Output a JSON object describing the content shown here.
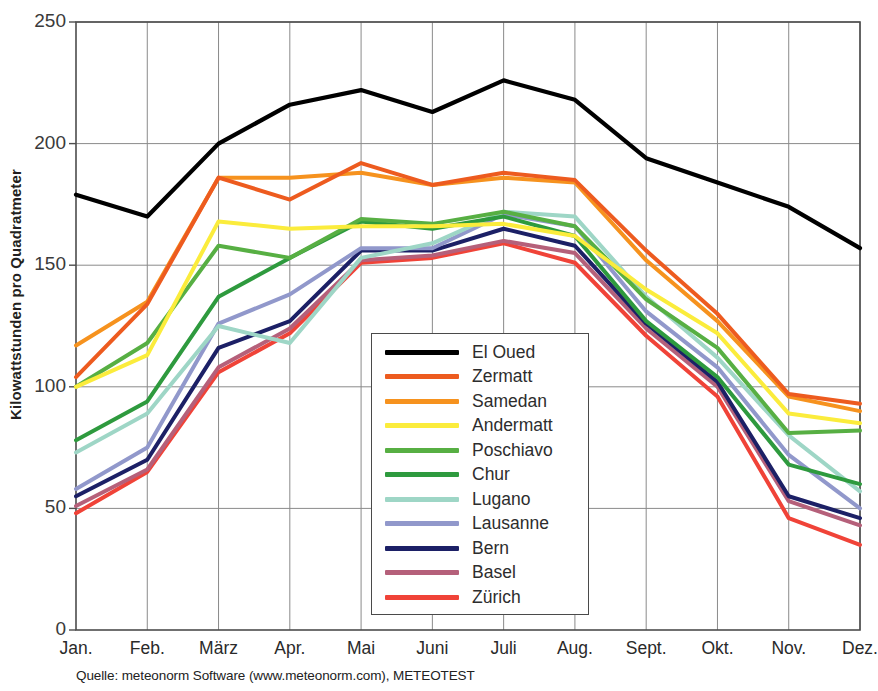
{
  "figure": {
    "title_fragment": "Globalstrahlung Monatssummen (kWh/m²)",
    "source_note": "Quelle: meteonorm Software (www.meteonorm.com), METEOTEST",
    "y_axis_label": "Kilowattstunden pro Quadratmeter"
  },
  "chart_data": {
    "type": "line",
    "title": "Globalstrahlung Monatssummen (kWh/m²)",
    "xlabel": "",
    "ylabel": "Kilowattstunden pro Quadratmeter",
    "ylim": [
      0,
      250
    ],
    "yticks": [
      0,
      50,
      100,
      150,
      200,
      250
    ],
    "grid": true,
    "legend_position": "center",
    "categories": [
      "Jan.",
      "Feb.",
      "März",
      "Apr.",
      "Mai",
      "Juni",
      "Juli",
      "Aug.",
      "Sept.",
      "Okt.",
      "Nov.",
      "Dez."
    ],
    "series": [
      {
        "name": "El Oued",
        "color": "#000000",
        "values": [
          179,
          170,
          200,
          216,
          222,
          213,
          226,
          218,
          194,
          184,
          174,
          157
        ]
      },
      {
        "name": "Zermatt",
        "color": "#ED5B1F",
        "values": [
          104,
          134,
          186,
          177,
          192,
          183,
          188,
          185,
          156,
          130,
          97,
          93
        ]
      },
      {
        "name": "Samedan",
        "color": "#F6921E",
        "values": [
          117,
          135,
          186,
          186,
          188,
          183,
          186,
          184,
          152,
          127,
          96,
          90
        ]
      },
      {
        "name": "Andermatt",
        "color": "#FBEC3C",
        "values": [
          100,
          113,
          168,
          165,
          166,
          166,
          167,
          162,
          140,
          122,
          89,
          85
        ]
      },
      {
        "name": "Poschiavo",
        "color": "#57AF43",
        "values": [
          100,
          118,
          158,
          153,
          169,
          167,
          172,
          166,
          136,
          116,
          81,
          82
        ]
      },
      {
        "name": "Chur",
        "color": "#2E9A3E",
        "values": [
          78,
          94,
          137,
          153,
          168,
          165,
          170,
          162,
          127,
          104,
          68,
          60
        ]
      },
      {
        "name": "Lugano",
        "color": "#9ED6C6",
        "values": [
          73,
          89,
          125,
          118,
          153,
          159,
          172,
          170,
          137,
          112,
          80,
          57
        ]
      },
      {
        "name": "Lausanne",
        "color": "#9198CB",
        "values": [
          58,
          75,
          126,
          138,
          157,
          157,
          171,
          166,
          131,
          108,
          72,
          50
        ]
      },
      {
        "name": "Bern",
        "color": "#1C2066",
        "values": [
          55,
          70,
          116,
          127,
          156,
          156,
          165,
          158,
          126,
          102,
          55,
          46
        ]
      },
      {
        "name": "Basel",
        "color": "#B5607A",
        "values": [
          51,
          66,
          108,
          124,
          152,
          154,
          160,
          155,
          124,
          100,
          53,
          43
        ]
      },
      {
        "name": "Zürich",
        "color": "#F04338",
        "values": [
          48,
          65,
          106,
          122,
          151,
          153,
          159,
          151,
          121,
          96,
          46,
          35
        ]
      }
    ]
  },
  "legend": {
    "entries": [
      {
        "label": "El Oued",
        "color": "#000000"
      },
      {
        "label": "Zermatt",
        "color": "#ED5B1F"
      },
      {
        "label": "Samedan",
        "color": "#F6921E"
      },
      {
        "label": "Andermatt",
        "color": "#FBEC3C"
      },
      {
        "label": "Poschiavo",
        "color": "#57AF43"
      },
      {
        "label": "Chur",
        "color": "#2E9A3E"
      },
      {
        "label": "Lugano",
        "color": "#9ED6C6"
      },
      {
        "label": "Lausanne",
        "color": "#9198CB"
      },
      {
        "label": "Bern",
        "color": "#1C2066"
      },
      {
        "label": "Basel",
        "color": "#B5607A"
      },
      {
        "label": "Zürich",
        "color": "#F04338"
      }
    ]
  }
}
